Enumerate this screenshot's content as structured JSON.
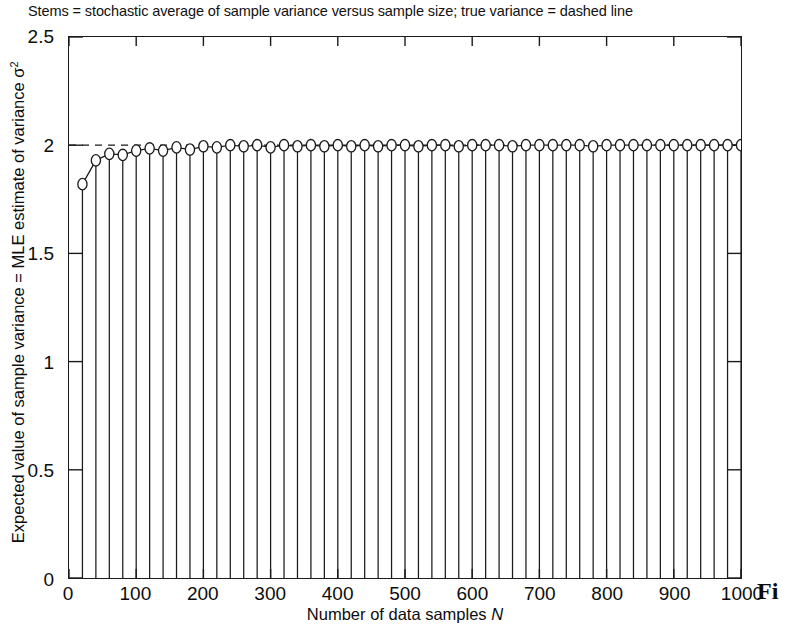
{
  "chart_data": {
    "type": "line",
    "title": "Stems = stochastic average of sample variance versus sample size; true variance = dashed line",
    "xlabel": "Number of data samples N",
    "ylabel": "Expected value of sample variance = MLE estimate of variance σ²",
    "xlim": [
      0,
      1000
    ],
    "ylim": [
      0,
      2.5
    ],
    "xticks": [
      0,
      100,
      200,
      300,
      400,
      500,
      600,
      700,
      800,
      900,
      1000
    ],
    "xtick_labels": [
      "0",
      "100",
      "200",
      "300",
      "400",
      "500",
      "600",
      "700",
      "800",
      "900",
      "1000"
    ],
    "yticks": [
      0,
      0.5,
      1,
      1.5,
      2,
      2.5
    ],
    "ytick_labels": [
      "0",
      "0.5",
      "1",
      "1.5",
      "2",
      "2.5"
    ],
    "grid": false,
    "legend": null,
    "marker": "open-circle",
    "stem_baseline": 0,
    "reference_line": {
      "value": 2,
      "style": "dashed",
      "label": "true variance"
    },
    "x": [
      20,
      40,
      60,
      80,
      100,
      120,
      140,
      160,
      180,
      200,
      220,
      240,
      260,
      280,
      300,
      320,
      340,
      360,
      380,
      400,
      420,
      440,
      460,
      480,
      500,
      520,
      540,
      560,
      580,
      600,
      620,
      640,
      660,
      680,
      700,
      720,
      740,
      760,
      780,
      800,
      820,
      840,
      860,
      880,
      900,
      920,
      940,
      960,
      980,
      1000
    ],
    "values": [
      1.82,
      1.93,
      1.96,
      1.955,
      1.975,
      1.985,
      1.975,
      1.99,
      1.98,
      1.995,
      1.99,
      2.0,
      1.995,
      2.0,
      1.99,
      2.0,
      1.995,
      2.0,
      1.995,
      2.0,
      1.995,
      2.0,
      1.995,
      2.0,
      2.0,
      1.995,
      2.0,
      2.0,
      1.995,
      2.0,
      2.0,
      2.0,
      1.995,
      2.0,
      2.0,
      2.0,
      2.0,
      2.0,
      1.995,
      2.0,
      2.0,
      2.0,
      2.0,
      2.0,
      2.0,
      2.0,
      2.0,
      2.0,
      2.0,
      2.0
    ],
    "series_name": "stochastic average of sample variance",
    "colors": {
      "line": "#1a1a1a",
      "marker_edge": "#1a1a1a",
      "marker_face": "#ffffff",
      "axis": "#1a1a1a"
    }
  },
  "caption": {
    "fragment": "Fi"
  }
}
